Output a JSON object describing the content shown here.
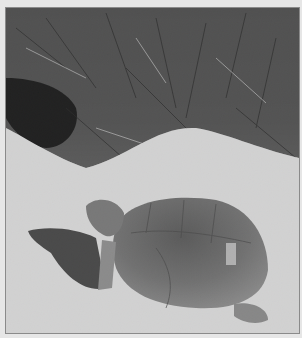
{
  "photo": {
    "subject": "gopher tortoise on sand near burrow",
    "style": "black-and-white photograph",
    "colors": {
      "margin": "#e6e6e6",
      "border": "#8a8a8a",
      "sand": "#d9d9d9",
      "vegetation": "#4a4a4a",
      "burrow": "#1c1c1c",
      "shell": "#6e6e6e",
      "shadow": "#2e2e2e"
    }
  }
}
